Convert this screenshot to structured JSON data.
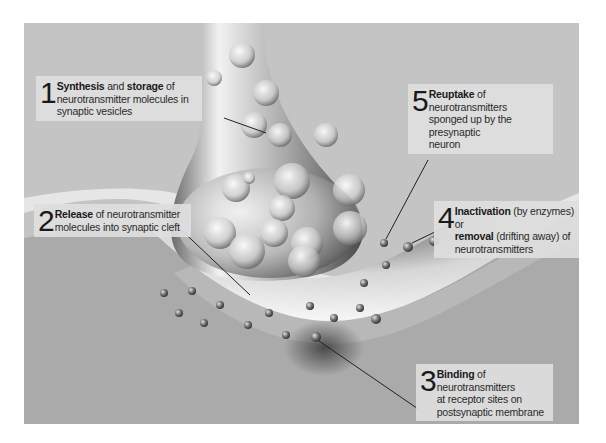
{
  "labels": [
    {
      "number": "1",
      "parts": [
        {
          "bold": "Synthesis"
        },
        {
          "text": " and "
        },
        {
          "bold": "storage"
        },
        {
          "text": " of neurotransmitter molecules in synaptic vesicles"
        }
      ]
    },
    {
      "number": "2",
      "parts": [
        {
          "bold": "Release"
        },
        {
          "text": " of neurotransmitter molecules into synaptic cleft"
        }
      ]
    },
    {
      "number": "3",
      "parts": [
        {
          "bold": "Binding"
        },
        {
          "text": " of neurotransmitters at receptor sites on postsynaptic membrane"
        }
      ]
    },
    {
      "number": "4",
      "parts": [
        {
          "bold": "Inactivation"
        },
        {
          "text": " (by enzymes) or "
        },
        {
          "bold": "removal"
        },
        {
          "text": " (drifting away) of neurotransmitters"
        }
      ]
    },
    {
      "number": "5",
      "parts": [
        {
          "bold": "Reuptake"
        },
        {
          "text": " of neurotransmitters sponged up by the presynaptic neuron"
        }
      ]
    }
  ],
  "l1": {
    "num": "1",
    "b1": "Synthesis",
    "t1": " and ",
    "b2": "storage",
    "t2": " of",
    "line2": "neurotransmitter molecules in",
    "line3": "synaptic vesicles"
  },
  "l2": {
    "num": "2",
    "b1": "Release",
    "t1": " of neurotransmitter",
    "line2": "molecules into synaptic cleft"
  },
  "l3": {
    "num": "3",
    "b1": "Binding",
    "t1": " of neurotransmitters",
    "line2": "at receptor sites on",
    "line3": "postsynaptic membrane"
  },
  "l4": {
    "num": "4",
    "b1": "Inactivation",
    "t1": " (by enzymes) or",
    "b2": "removal",
    "t2": " (drifting away) of",
    "line3": "neurotransmitters"
  },
  "l5": {
    "num": "5",
    "b1": "Reuptake",
    "t1": " of neurotransmitters",
    "line2": "sponged up by the presynaptic",
    "line3": "neuron"
  },
  "colors": {
    "background": "#c4c4c4",
    "postsynaptic": "#a9a9a9",
    "membrane": "#e8e8e8",
    "leader": "#222222"
  }
}
